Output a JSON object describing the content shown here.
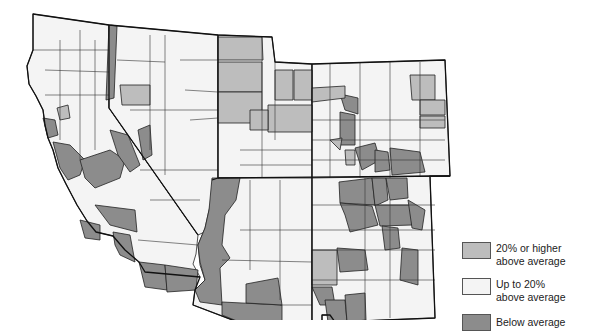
{
  "map": {
    "subject": "County map of southwestern U.S. states (California, Nevada, Utah, Colorado, Arizona, New Mexico) shaded by category",
    "colors": {
      "high": "#bdbdbd",
      "moderate": "#f4f4f4",
      "below": "#8c8c8c",
      "border": "#222222"
    }
  },
  "legend": {
    "items": [
      {
        "label_line1": "20% or higher",
        "label_line2": "above average",
        "color": "#bdbdbd"
      },
      {
        "label_line1": "Up to 20%",
        "label_line2": "above average",
        "color": "#f4f4f4"
      },
      {
        "label_line1": "Below average",
        "label_line2": "",
        "color": "#8c8c8c"
      }
    ]
  }
}
